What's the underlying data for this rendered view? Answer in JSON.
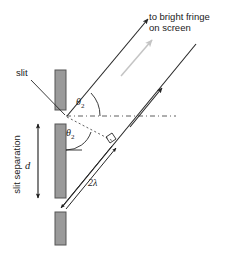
{
  "figure": {
    "title_alt": "Double-slit interference geometry showing path difference of two wavelengths",
    "background_color": "#ffffff"
  },
  "labels": {
    "to_bright_fringe_line1": "to bright fringe",
    "to_bright_fringe_line2": "on screen",
    "slit": "slit",
    "slit_separation": "slit separation",
    "separation_symbol": "d",
    "theta_symbol": "θ",
    "theta_subscript": "2",
    "path_difference": "2λ"
  },
  "colors": {
    "barrier_fill": "#9a9a9a",
    "barrier_stroke": "#555555",
    "ray_stroke": "#262626",
    "dashed_stroke": "#4d4d4d",
    "gray_arrow": "#c4c4c4",
    "text": "#1a1a1a"
  },
  "geometry": {
    "barriers": [
      {
        "name": "top-barrier",
        "x": 55,
        "y": 70,
        "width": 11,
        "height": 40
      },
      {
        "name": "middle-barrier",
        "x": 55,
        "y": 124,
        "width": 11,
        "height": 74
      },
      {
        "name": "bottom-barrier",
        "x": 55,
        "y": 212,
        "width": 11,
        "height": 33
      }
    ],
    "slit_upper_center": {
      "x": 67,
      "y": 117
    },
    "slit_lower_center": {
      "x": 67,
      "y": 205
    },
    "ray_angle_deg": 42,
    "path_difference_wavelengths": 2
  }
}
